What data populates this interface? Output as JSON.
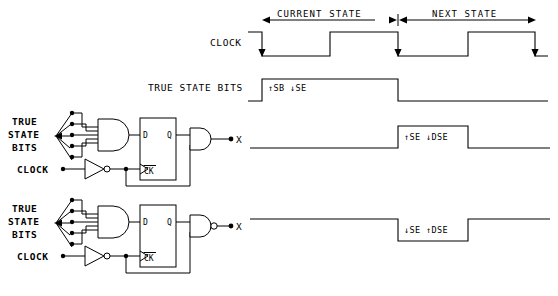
{
  "timing": {
    "regions": [
      {
        "id": "current-state",
        "label": "CURRENT STATE"
      },
      {
        "id": "next-state",
        "label": "NEXT STATE"
      }
    ],
    "signals": [
      {
        "id": "clock",
        "label": "CLOCK",
        "annotation": ""
      },
      {
        "id": "true-state-bits",
        "label": "TRUE STATE BITS",
        "annotation": "↑SB ↓SE"
      },
      {
        "id": "x-high-pulse",
        "label": "",
        "annotation": "↑SE ↓DSE"
      },
      {
        "id": "x-low-pulse",
        "label": "",
        "annotation": "↓SE ↑DSE"
      }
    ]
  },
  "circuits": [
    {
      "id": "circuit-and",
      "input_label_lines": [
        "TRUE",
        "STATE",
        "BITS"
      ],
      "clock_label": "CLOCK",
      "flipflop": {
        "d_pin": "D",
        "q_pin": "Q",
        "ck_pin": "CK"
      },
      "output_label": "X",
      "output_gate": "AND"
    },
    {
      "id": "circuit-nand",
      "input_label_lines": [
        "TRUE",
        "STATE",
        "BITS"
      ],
      "clock_label": "CLOCK",
      "flipflop": {
        "d_pin": "D",
        "q_pin": "Q",
        "ck_pin": "CK"
      },
      "output_label": "X",
      "output_gate": "NAND"
    }
  ],
  "colors": {
    "ink": "#000000",
    "paper": "#ffffff"
  }
}
